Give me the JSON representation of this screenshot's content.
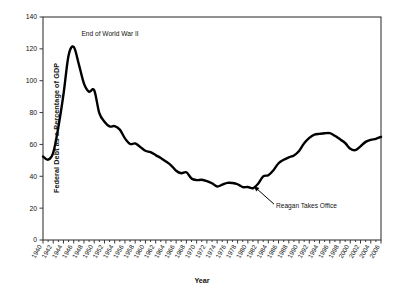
{
  "chart_data": {
    "type": "line",
    "title": "",
    "xlabel": "Year",
    "ylabel": "Federal Debt as a Percentage of GDP",
    "xlim": [
      1940,
      2006
    ],
    "ylim": [
      0,
      140
    ],
    "ytick_step": 20,
    "xtick_step": 2,
    "grid": false,
    "legend": "none",
    "line_color": "#000000",
    "yticks": [
      "0",
      "20",
      "40",
      "60",
      "80",
      "100",
      "120",
      "140"
    ],
    "xticks": [
      "1940",
      "1942",
      "1944",
      "1946",
      "1948",
      "1950",
      "1952",
      "1954",
      "1956",
      "1958",
      "1960",
      "1962",
      "1964",
      "1966",
      "1968",
      "1970",
      "1972",
      "1974",
      "1976",
      "1978",
      "1980",
      "1982",
      "1984",
      "1986",
      "1988",
      "1990",
      "1992",
      "1994",
      "1996",
      "1998",
      "2000",
      "2002",
      "2004",
      "2006"
    ],
    "x": [
      1940,
      1941,
      1942,
      1943,
      1944,
      1945,
      1946,
      1947,
      1948,
      1949,
      1950,
      1951,
      1952,
      1953,
      1954,
      1955,
      1956,
      1957,
      1958,
      1959,
      1960,
      1961,
      1962,
      1963,
      1964,
      1965,
      1966,
      1967,
      1968,
      1969,
      1970,
      1971,
      1972,
      1973,
      1974,
      1975,
      1976,
      1977,
      1978,
      1979,
      1980,
      1981,
      1982,
      1983,
      1984,
      1985,
      1986,
      1987,
      1988,
      1989,
      1990,
      1991,
      1992,
      1993,
      1994,
      1995,
      1996,
      1997,
      1998,
      1999,
      2000,
      2001,
      2002,
      2003,
      2004,
      2005,
      2006
    ],
    "values": [
      52.4,
      50.4,
      54.9,
      70.9,
      91.5,
      116.0,
      121.2,
      110.3,
      98.2,
      93.1,
      94.0,
      79.6,
      74.3,
      71.3,
      71.5,
      69.3,
      63.8,
      60.3,
      60.6,
      58.4,
      56.0,
      55.1,
      53.3,
      51.5,
      49.3,
      46.9,
      43.5,
      41.9,
      42.5,
      38.6,
      37.6,
      37.8,
      37.0,
      35.6,
      33.6,
      34.7,
      35.9,
      35.8,
      35.0,
      33.2,
      33.3,
      32.5,
      35.3,
      39.9,
      40.7,
      43.8,
      48.2,
      50.4,
      51.9,
      53.1,
      55.9,
      60.7,
      64.1,
      66.1,
      66.6,
      67.0,
      67.1,
      65.4,
      63.2,
      60.9,
      57.3,
      56.4,
      58.8,
      61.6,
      62.9,
      63.5,
      64.8
    ],
    "annotations": [
      {
        "name": "end-of-wwii",
        "text": "End of World War II",
        "x": 1946,
        "y": 121.2,
        "label_x": 1947.5,
        "label_y": 128
      },
      {
        "name": "reagan-takes-office",
        "text": "Reagan Takes Office",
        "x": 1981,
        "y": 32.5,
        "label_x": 1985.5,
        "label_y": 20
      }
    ]
  }
}
